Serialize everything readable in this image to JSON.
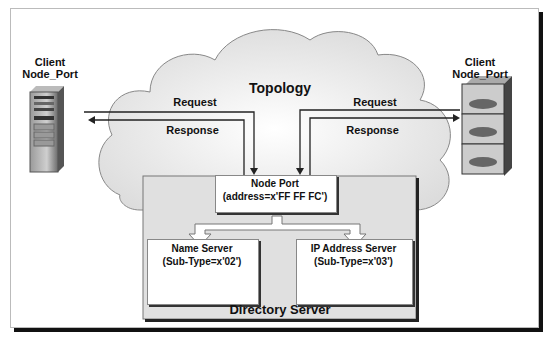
{
  "diagram": {
    "cloud_label": "Topology",
    "left_client": {
      "line1": "Client",
      "line2": "Node_Port",
      "icon": "tower-server-icon"
    },
    "right_client": {
      "line1": "Client",
      "line2": "Node_Port",
      "icon": "rack-storage-icon"
    },
    "left_request": "Request",
    "left_response": "Response",
    "right_request": "Request",
    "right_response": "Response",
    "node_port": {
      "line1": "Node Port",
      "line2": "(address=x'FF FF FC')"
    },
    "name_server": {
      "line1": "Name Server",
      "line2": "(Sub-Type=x'02')",
      "icon": "database-icon"
    },
    "ip_server": {
      "line1": "IP Address  Server",
      "line2": "(Sub-Type=x'03')",
      "icon": "database-icon"
    },
    "directory_server": "Directory Server",
    "colors": {
      "cloud": "#e6e6e6",
      "directory": "#e0e0e0",
      "box_border": "#777777",
      "disk": "#555555",
      "shadow": "#111111"
    }
  }
}
